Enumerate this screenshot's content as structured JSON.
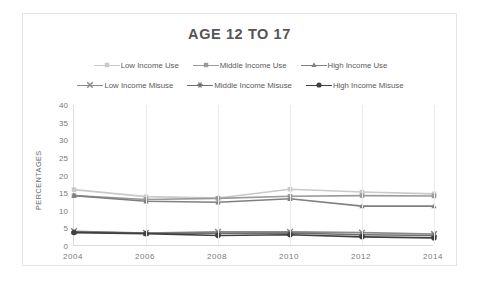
{
  "chart": {
    "title": "AGE 12 TO 17",
    "y_axis_title": "PERCENTAGES",
    "y_ticks": [
      "40",
      "35",
      "30",
      "25",
      "20",
      "15",
      "10",
      "5",
      "0"
    ],
    "x_ticks": [
      "2004",
      "2006",
      "2008",
      "2010",
      "2012",
      "2014"
    ]
  },
  "legend": {
    "rows": [
      [
        {
          "label": "Low Income Use",
          "marker": "square-marker",
          "color": "#c9c9c9"
        },
        {
          "label": "Middle Income Use",
          "marker": "square-marker",
          "color": "#9a9a9a"
        },
        {
          "label": "High Income Use",
          "marker": "triangle-marker",
          "color": "#808080"
        }
      ],
      [
        {
          "label": "Low Income Misuse",
          "marker": "x-marker",
          "color": "#8a8a8a"
        },
        {
          "label": "Middle Income Misuse",
          "marker": "asterisk-marker",
          "color": "#6e6e6e"
        },
        {
          "label": "High Income Misuse",
          "marker": "circle-marker",
          "color": "#3f3f3f"
        }
      ]
    ]
  },
  "chart_data": {
    "type": "line",
    "title": "AGE 12 TO 17",
    "xlabel": "",
    "ylabel": "PERCENTAGES",
    "x": [
      2004,
      2006,
      2008,
      2010,
      2012,
      2014
    ],
    "categories": [
      "2004",
      "2006",
      "2008",
      "2010",
      "2012",
      "2014"
    ],
    "xlim": [
      2004,
      2014
    ],
    "ylim": [
      0,
      40
    ],
    "ytick_step": 5,
    "grid": "vertical-only",
    "legend_position": "top",
    "series": [
      {
        "name": "Low Income Use",
        "marker": "square",
        "color": "#c9c9c9",
        "values": [
          16.0,
          14.0,
          13.6,
          16.1,
          15.3,
          14.8
        ]
      },
      {
        "name": "Middle Income Use",
        "marker": "square",
        "color": "#9a9a9a",
        "values": [
          14.3,
          13.2,
          13.5,
          14.1,
          14.3,
          14.2
        ]
      },
      {
        "name": "High Income Use",
        "marker": "triangle",
        "color": "#808080",
        "values": [
          14.3,
          12.7,
          12.4,
          13.4,
          11.3,
          11.3
        ]
      },
      {
        "name": "Low Income Misuse",
        "marker": "x",
        "color": "#8a8a8a",
        "values": [
          4.2,
          3.7,
          4.0,
          4.0,
          3.8,
          3.4
        ]
      },
      {
        "name": "Middle Income Misuse",
        "marker": "asterisk",
        "color": "#6e6e6e",
        "values": [
          4.0,
          3.6,
          3.6,
          3.7,
          3.2,
          3.0
        ]
      },
      {
        "name": "High Income Misuse",
        "marker": "circle",
        "color": "#3f3f3f",
        "values": [
          3.8,
          3.5,
          3.0,
          3.2,
          2.6,
          2.3
        ]
      }
    ]
  }
}
